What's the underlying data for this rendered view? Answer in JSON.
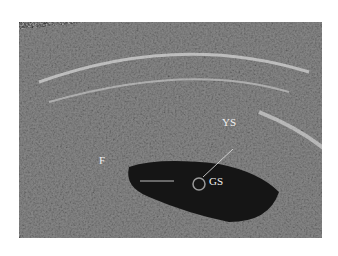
{
  "image": {
    "description": "Transvaginal ultrasound showing gestational sac with yolk sac and fetal pole",
    "labels": {
      "ys": "YS",
      "f": "F",
      "gs": "GS"
    }
  }
}
